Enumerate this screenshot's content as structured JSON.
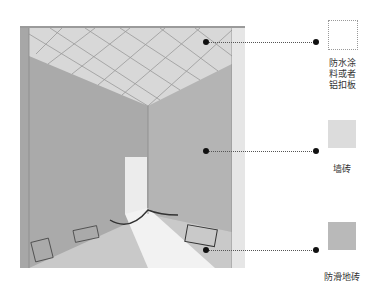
{
  "diagram": {
    "callouts": [
      {
        "id": "ceiling",
        "label_lines": [
          "防水涂",
          "料或者",
          "铝扣板"
        ],
        "swatch_color": "#ffffff",
        "swatch_style": "dotted-outline"
      },
      {
        "id": "wall",
        "label_lines": [
          "墙砖"
        ],
        "swatch_color": "#dcdcdc"
      },
      {
        "id": "floor",
        "label_lines": [
          "防滑地砖"
        ],
        "swatch_color": "#b9b9b9"
      }
    ]
  },
  "colors": {
    "ceiling": "#d6d6d6",
    "wall_left": "#a9a9a9",
    "wall_right": "#b3b3b3",
    "floor": "#c8c8c8",
    "light": "#efefef",
    "leader": "#555555",
    "dot": "#111111"
  }
}
